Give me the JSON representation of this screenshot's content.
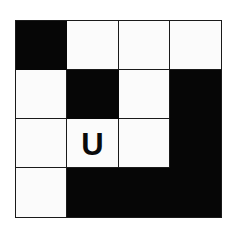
{
  "figure": {
    "type": "grid-puzzle",
    "name": "black-white-grid-with-letter",
    "rows": 4,
    "columns": 4,
    "colors": {
      "filled": "#060606",
      "empty": "#fbfbfb",
      "gridline": "#1a1a1a",
      "background": "#ffffff",
      "letter": "#0a0a0a"
    },
    "cells": [
      {
        "row": 1,
        "col": 1,
        "state": "black",
        "letter": ""
      },
      {
        "row": 1,
        "col": 2,
        "state": "white",
        "letter": ""
      },
      {
        "row": 1,
        "col": 3,
        "state": "white",
        "letter": ""
      },
      {
        "row": 1,
        "col": 4,
        "state": "white",
        "letter": ""
      },
      {
        "row": 2,
        "col": 1,
        "state": "white",
        "letter": ""
      },
      {
        "row": 2,
        "col": 2,
        "state": "black",
        "letter": ""
      },
      {
        "row": 2,
        "col": 3,
        "state": "white",
        "letter": ""
      },
      {
        "row": 2,
        "col": 4,
        "state": "black",
        "letter": ""
      },
      {
        "row": 3,
        "col": 1,
        "state": "white",
        "letter": ""
      },
      {
        "row": 3,
        "col": 2,
        "state": "white",
        "letter": "U"
      },
      {
        "row": 3,
        "col": 3,
        "state": "white",
        "letter": ""
      },
      {
        "row": 3,
        "col": 4,
        "state": "black",
        "letter": ""
      },
      {
        "row": 4,
        "col": 1,
        "state": "white",
        "letter": ""
      },
      {
        "row": 4,
        "col": 2,
        "state": "black",
        "letter": ""
      },
      {
        "row": 4,
        "col": 3,
        "state": "black",
        "letter": ""
      },
      {
        "row": 4,
        "col": 4,
        "state": "black",
        "letter": ""
      }
    ]
  }
}
